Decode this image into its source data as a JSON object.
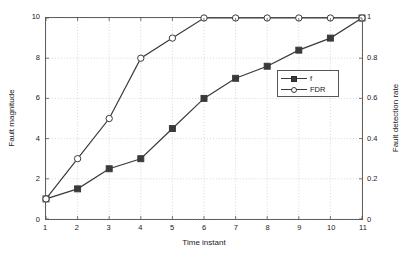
{
  "chart_data": {
    "type": "line",
    "title": "",
    "xlabel": "Time instant",
    "ylabel": "Fault magnitude",
    "ylabel_right": "Fault detection rate",
    "grid": true,
    "legend_position": "center-right",
    "x": [
      1,
      2,
      3,
      4,
      5,
      6,
      7,
      8,
      9,
      10,
      11
    ],
    "xlim": [
      1,
      11
    ],
    "ylim": [
      0,
      10
    ],
    "ylim_right": [
      0,
      1
    ],
    "xticks": [
      "1",
      "2",
      "3",
      "4",
      "5",
      "6",
      "7",
      "8",
      "9",
      "10",
      "11"
    ],
    "yticks_left": [
      "0",
      "2",
      "4",
      "6",
      "8",
      "10"
    ],
    "yticks_right": [
      "0",
      "0.2",
      "0.4",
      "0.6",
      "0.8",
      "1"
    ],
    "series": [
      {
        "name": "f",
        "marker": "square",
        "axis": "left",
        "color": "#3a3a3a",
        "values": [
          1,
          1.5,
          2.5,
          3,
          4.5,
          6,
          7,
          7.6,
          8.4,
          9,
          10
        ]
      },
      {
        "name": "FDR",
        "marker": "circle",
        "axis": "right",
        "color": "#3a3a3a",
        "values": [
          0.1,
          0.3,
          0.5,
          0.8,
          0.9,
          1,
          1,
          1,
          1,
          1,
          1
        ]
      }
    ]
  },
  "legend": {
    "entries": [
      {
        "label": "f"
      },
      {
        "label": "FDR"
      }
    ]
  },
  "colors": {
    "axis": "#555555",
    "grid": "#bbbbbb",
    "line": "#3a3a3a",
    "marker_fill_square": "#3a3a3a",
    "marker_fill_circle": "#ffffff",
    "background": "#ffffff"
  }
}
